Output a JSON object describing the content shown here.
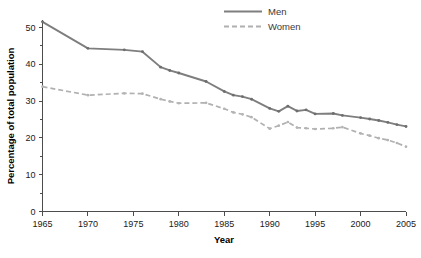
{
  "chart_data": {
    "type": "line",
    "title": "",
    "subtitle": "",
    "xlabel": "Year",
    "ylabel": "Percentage of total population",
    "xlim": [
      1965,
      2005
    ],
    "ylim": [
      0,
      52
    ],
    "grid": false,
    "legend_position": "top-center",
    "x_ticks": [
      "1965",
      "1970",
      "1975",
      "1980",
      "1985",
      "1990",
      "1995",
      "2000",
      "2005"
    ],
    "x_tick_values": [
      1965,
      1970,
      1975,
      1980,
      1985,
      1990,
      1995,
      2000,
      2005
    ],
    "y_ticks": [
      "0",
      "10",
      "20",
      "30",
      "40",
      "50"
    ],
    "y_tick_values": [
      0,
      10,
      20,
      30,
      40,
      50
    ],
    "y_minor_tick_values": [
      5,
      15,
      25,
      35,
      45
    ],
    "series": [
      {
        "name": "Men",
        "style": "solid",
        "color": "#7e7e7e",
        "x": [
          1965,
          1970,
          1974,
          1976,
          1978,
          1979,
          1980,
          1983,
          1985,
          1986,
          1987,
          1988,
          1990,
          1991,
          1992,
          1993,
          1994,
          1995,
          1997,
          1998,
          2000,
          2001,
          2002,
          2003,
          2004,
          2005
        ],
        "values": [
          51.5,
          44.3,
          43.9,
          43.4,
          39.2,
          38.3,
          37.6,
          35.3,
          32.6,
          31.6,
          31.2,
          30.5,
          28.0,
          27.2,
          28.6,
          27.3,
          27.6,
          26.5,
          26.6,
          26.1,
          25.5,
          25.1,
          24.7,
          24.2,
          23.6,
          23.1
        ],
        "n_points": 26
      },
      {
        "name": "Women",
        "style": "dashed",
        "color": "#b0b0b0",
        "x": [
          1965,
          1970,
          1974,
          1976,
          1978,
          1979,
          1980,
          1983,
          1985,
          1986,
          1987,
          1988,
          1990,
          1991,
          1992,
          1993,
          1994,
          1995,
          1997,
          1998,
          2000,
          2001,
          2002,
          2003,
          2004,
          2005
        ],
        "values": [
          33.9,
          31.6,
          32.1,
          32.0,
          30.5,
          29.9,
          29.4,
          29.5,
          27.9,
          26.9,
          26.4,
          25.6,
          22.5,
          23.3,
          24.3,
          22.8,
          22.6,
          22.4,
          22.6,
          22.9,
          21.2,
          20.6,
          19.9,
          19.4,
          18.6,
          17.6
        ],
        "n_points": 26
      }
    ],
    "legend": [
      {
        "label": "Men",
        "style": "solid",
        "color": "#7e7e7e"
      },
      {
        "label": "Women",
        "style": "dashed",
        "color": "#b0b0b0"
      }
    ]
  },
  "axes": {
    "x_axis_title": "Year",
    "y_axis_title": "Percentage of total population"
  },
  "legend": {
    "men_label": "Men",
    "women_label": "Women"
  },
  "colors": {
    "men": "#7e7e7e",
    "women": "#b0b0b0",
    "axis": "#4c4c4c",
    "text": "#1a1a1a",
    "background": "#ffffff"
  }
}
